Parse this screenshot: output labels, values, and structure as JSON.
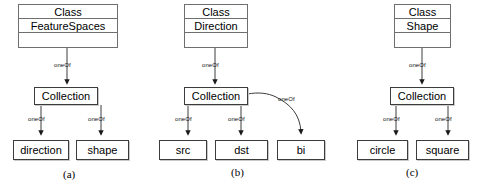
{
  "figure": {
    "kind": "uml-class-instance-diagram",
    "background": "#ffffff",
    "line_color": "#3c3c3c",
    "panels": [
      {
        "id": "a",
        "caption": "(a)",
        "class_box": {
          "stereotype": "Class",
          "name": "FeatureSpaces",
          "third_compartment": ""
        },
        "collection": "Collection",
        "edges": [
          {
            "label": "oneOf",
            "from": "class",
            "to": "collection"
          },
          {
            "label": "oneOf",
            "from": "collection",
            "to": "direction"
          },
          {
            "label": "oneOf",
            "from": "collection",
            "to": "shape"
          }
        ],
        "leaves": [
          "direction",
          "shape"
        ]
      },
      {
        "id": "b",
        "caption": "(b)",
        "class_box": {
          "stereotype": "Class",
          "name": "Direction",
          "third_compartment": ""
        },
        "collection": "Collection",
        "edges": [
          {
            "label": "oneOf",
            "from": "class",
            "to": "collection"
          },
          {
            "label": "oneOf",
            "from": "collection",
            "to": "src"
          },
          {
            "label": "oneOf",
            "from": "collection",
            "to": "dst"
          },
          {
            "label": "oneOf",
            "from": "collection",
            "to": "bi"
          }
        ],
        "leaves": [
          "src",
          "dst",
          "bi"
        ]
      },
      {
        "id": "c",
        "caption": "(c)",
        "class_box": {
          "stereotype": "Class",
          "name": "Shape",
          "third_compartment": ""
        },
        "collection": "Collection",
        "edges": [
          {
            "label": "oneOf",
            "from": "class",
            "to": "collection"
          },
          {
            "label": "oneOf",
            "from": "collection",
            "to": "circle"
          },
          {
            "label": "oneOf",
            "from": "collection",
            "to": "square"
          }
        ],
        "leaves": [
          "circle",
          "square"
        ]
      }
    ]
  }
}
